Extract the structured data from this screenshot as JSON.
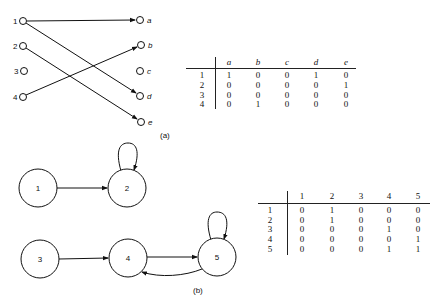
{
  "figure_a": {
    "caption": "(a)",
    "left_nodes": [
      "1",
      "2",
      "3",
      "4"
    ],
    "right_nodes": [
      "a",
      "b",
      "c",
      "d",
      "e"
    ],
    "edges": [
      [
        "1",
        "a"
      ],
      [
        "1",
        "d"
      ],
      [
        "2",
        "e"
      ],
      [
        "4",
        "b"
      ]
    ],
    "matrix": {
      "columns": [
        "a",
        "b",
        "c",
        "d",
        "e"
      ],
      "rows": [
        {
          "label": "1",
          "values": [
            "1",
            "0",
            "0",
            "1",
            "0"
          ]
        },
        {
          "label": "2",
          "values": [
            "0",
            "0",
            "0",
            "0",
            "1"
          ]
        },
        {
          "label": "3",
          "values": [
            "0",
            "0",
            "0",
            "0",
            "0"
          ]
        },
        {
          "label": "4",
          "values": [
            "0",
            "1",
            "0",
            "0",
            "0"
          ]
        }
      ]
    }
  },
  "figure_b": {
    "caption": "(b)",
    "nodes": [
      "1",
      "2",
      "3",
      "4",
      "5"
    ],
    "edges": [
      [
        "1",
        "2"
      ],
      [
        "2",
        "2"
      ],
      [
        "3",
        "4"
      ],
      [
        "4",
        "5"
      ],
      [
        "5",
        "4"
      ],
      [
        "5",
        "5"
      ]
    ],
    "matrix": {
      "columns": [
        "1",
        "2",
        "3",
        "4",
        "5"
      ],
      "rows": [
        {
          "label": "1",
          "values": [
            "0",
            "1",
            "0",
            "0",
            "0"
          ]
        },
        {
          "label": "2",
          "values": [
            "0",
            "1",
            "0",
            "0",
            "0"
          ]
        },
        {
          "label": "3",
          "values": [
            "0",
            "0",
            "0",
            "1",
            "0"
          ]
        },
        {
          "label": "4",
          "values": [
            "0",
            "0",
            "0",
            "0",
            "1"
          ]
        },
        {
          "label": "5",
          "values": [
            "0",
            "0",
            "0",
            "1",
            "1"
          ]
        }
      ]
    }
  }
}
